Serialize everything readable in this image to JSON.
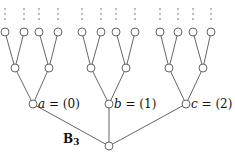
{
  "diagram": {
    "title": "B",
    "title_subscript": "3",
    "root": {
      "x": 109,
      "y": 146
    },
    "level1": [
      {
        "x": 33,
        "y": 104,
        "var": "a",
        "eq": " = (0)"
      },
      {
        "x": 109,
        "y": 104,
        "var": "b",
        "eq": " = (1)"
      },
      {
        "x": 186,
        "y": 104,
        "var": "c",
        "eq": " = (2)"
      }
    ],
    "level2": [
      {
        "x": 15,
        "y": 68,
        "parent": 0
      },
      {
        "x": 49,
        "y": 68,
        "parent": 0
      },
      {
        "x": 91,
        "y": 68,
        "parent": 1
      },
      {
        "x": 126,
        "y": 68,
        "parent": 1
      },
      {
        "x": 169,
        "y": 68,
        "parent": 2
      },
      {
        "x": 203,
        "y": 68,
        "parent": 2
      }
    ],
    "level3": [
      {
        "x": 5,
        "y": 32,
        "parent": 0
      },
      {
        "x": 24,
        "y": 32,
        "parent": 0
      },
      {
        "x": 39,
        "y": 32,
        "parent": 1
      },
      {
        "x": 58,
        "y": 32,
        "parent": 1
      },
      {
        "x": 82,
        "y": 32,
        "parent": 2
      },
      {
        "x": 101,
        "y": 32,
        "parent": 2
      },
      {
        "x": 116,
        "y": 32,
        "parent": 3
      },
      {
        "x": 135,
        "y": 32,
        "parent": 3
      },
      {
        "x": 160,
        "y": 32,
        "parent": 4
      },
      {
        "x": 178,
        "y": 32,
        "parent": 4
      },
      {
        "x": 193,
        "y": 32,
        "parent": 5
      },
      {
        "x": 211,
        "y": 32,
        "parent": 5
      }
    ],
    "continuation_dots_y": [
      9,
      14,
      19
    ],
    "node_radius": 4
  }
}
